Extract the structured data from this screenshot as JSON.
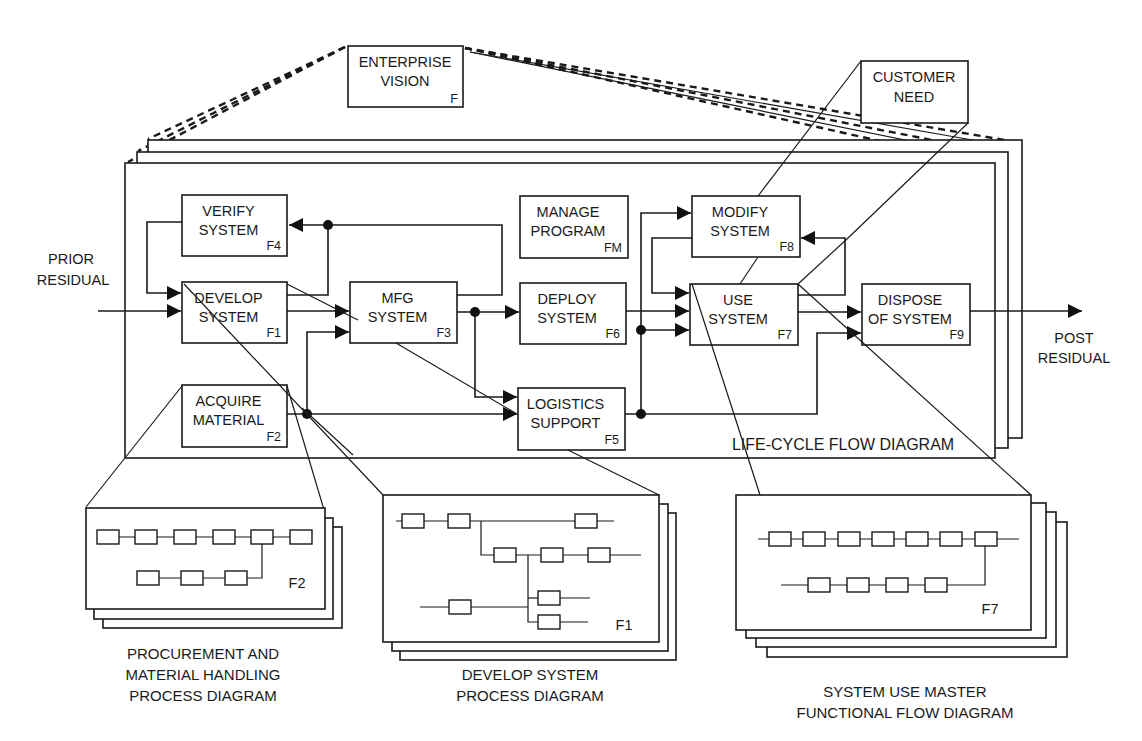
{
  "diagram": {
    "enterprise_vision": {
      "line1": "ENTERPRISE",
      "line2": "VISION",
      "id": "F"
    },
    "customer_need": {
      "line1": "CUSTOMER",
      "line2": "NEED"
    },
    "external_labels": {
      "prior_residual": [
        "PRIOR",
        "RESIDUAL"
      ],
      "post_residual": [
        "POST",
        "RESIDUAL"
      ]
    },
    "life_cycle_label": "LIFE-CYCLE FLOW  DIAGRAM",
    "functions": [
      {
        "key": "verify",
        "line1": "VERIFY",
        "line2": "SYSTEM",
        "id": "F4"
      },
      {
        "key": "develop",
        "line1": "DEVELOP",
        "line2": "SYSTEM",
        "id": "F1"
      },
      {
        "key": "mfg",
        "line1": "MFG",
        "line2": "SYSTEM",
        "id": "F3"
      },
      {
        "key": "manage",
        "line1": "MANAGE",
        "line2": "PROGRAM",
        "id": "FM"
      },
      {
        "key": "deploy",
        "line1": "DEPLOY",
        "line2": "SYSTEM",
        "id": "F6"
      },
      {
        "key": "modify",
        "line1": "MODIFY",
        "line2": "SYSTEM",
        "id": "F8"
      },
      {
        "key": "use",
        "line1": "USE",
        "line2": "SYSTEM",
        "id": "F7"
      },
      {
        "key": "dispose",
        "line1": "DISPOSE",
        "line2": "OF SYSTEM",
        "id": "F9"
      },
      {
        "key": "acquire",
        "line1": "ACQUIRE",
        "line2": "MATERIAL",
        "id": "F2"
      },
      {
        "key": "logistics",
        "line1": "LOGISTICS",
        "line2": "SUPPORT",
        "id": "F5"
      }
    ],
    "sub_diagrams": [
      {
        "key": "procurement",
        "id": "F2",
        "caption": [
          "PROCUREMENT AND",
          "MATERIAL HANDLING",
          "PROCESS DIAGRAM"
        ]
      },
      {
        "key": "develop",
        "id": "F1",
        "caption": [
          "DEVELOP SYSTEM",
          "PROCESS DIAGRAM"
        ]
      },
      {
        "key": "system_use",
        "id": "F7",
        "caption": [
          "SYSTEM USE MASTER",
          "FUNCTIONAL FLOW DIAGRAM"
        ]
      }
    ]
  }
}
